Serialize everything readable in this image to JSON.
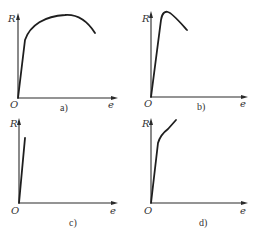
{
  "figure": {
    "panels": [
      {
        "id": "a",
        "caption": "a)",
        "y_axis_label": "R",
        "x_axis_label": "e",
        "origin_label": "O",
        "curve_description": "steep linear rise then broad rounded maximum, followed by decline"
      },
      {
        "id": "b",
        "caption": "b)",
        "y_axis_label": "R",
        "x_axis_label": "e",
        "origin_label": "O",
        "curve_description": "very steep rise to a sharp peak, then linear decline"
      },
      {
        "id": "c",
        "caption": "c)",
        "y_axis_label": "R",
        "x_axis_label": "e",
        "origin_label": "O",
        "curve_description": "straight steep line ending abruptly (brittle)"
      },
      {
        "id": "d",
        "caption": "d)",
        "y_axis_label": "R",
        "x_axis_label": "e",
        "origin_label": "O",
        "curve_description": "steep linear rise then knee and continued rise with lower slope"
      }
    ]
  }
}
